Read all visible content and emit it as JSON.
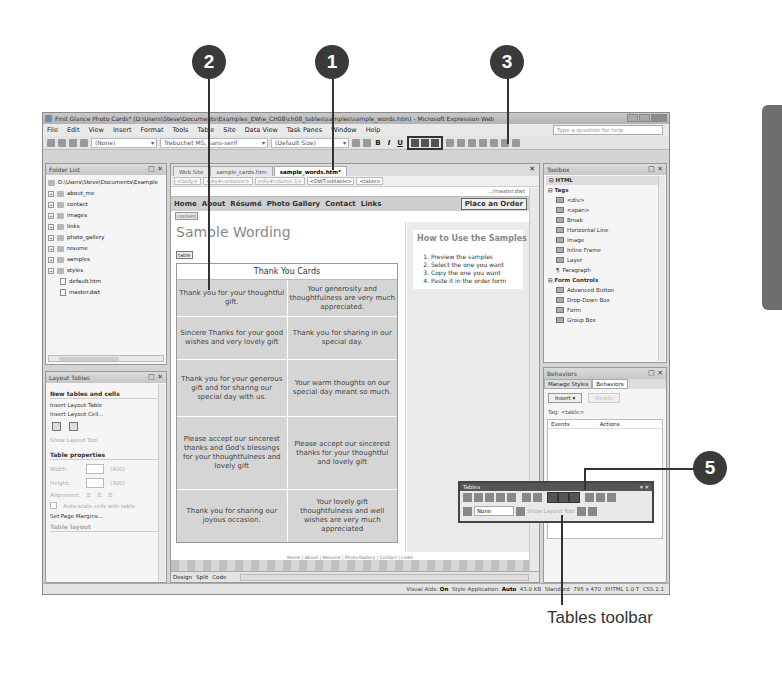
{
  "window": {
    "title": "First Glance Photo Cards* (D:\\Users\\Steve\\Documents\\Examples_EW\\e_CH08\\ch08_tables\\samples\\sample_words.htm) - Microsoft Expression Web"
  },
  "menu": [
    "File",
    "Edit",
    "View",
    "Insert",
    "Format",
    "Tools",
    "Table",
    "Site",
    "Data View",
    "Task Panes",
    "Window",
    "Help"
  ],
  "help_placeholder": "Type a question for help",
  "toolbar": {
    "style": "(None)",
    "font": "Trebuchet MS, sans-serif",
    "size": "(Default Size)",
    "bold": "B",
    "italic": "I",
    "underline": "U"
  },
  "folder_list": {
    "title": "Folder List",
    "root": "D:\\Users\\Steve\\Documents\\Example",
    "folders": [
      "about_me",
      "contact",
      "images",
      "links",
      "photo_gallery",
      "resume",
      "samples",
      "styles"
    ],
    "files": [
      "default.htm",
      "master.dwt"
    ]
  },
  "layout_tables": {
    "title": "Layout Tables",
    "section1": "New tables and cells",
    "insert_table": "Insert Layout Table",
    "insert_cell": "Insert Layout Cell...",
    "show_tool": "Show Layout Tool",
    "section2": "Table properties",
    "width_label": "Width:",
    "width_val": "(400)",
    "height_label": "Height:",
    "height_val": "(300)",
    "alignment_label": "Alignment:",
    "autoscale": "Auto-scale cells with table",
    "margins": "Set Page Margins...",
    "section3": "Table layout"
  },
  "editor": {
    "tabs": [
      "Web Site",
      "sample_cards.htm",
      "sample_words.htm*"
    ],
    "crumbs": [
      "<body>",
      "<div#container>",
      "<div#column_1>",
      "<DWT:editable>",
      "<table>"
    ],
    "master": "../master.dwt",
    "nav": [
      "Home",
      "About",
      "Résumé",
      "Photo Gallery",
      "Contact",
      "Links"
    ],
    "order_button": "Place an Order",
    "content_tag": "content",
    "page_title": "Sample Wording",
    "table_tag": "table",
    "cards_heading": "Thank You Cards",
    "cards": [
      "Thank you for your thoughtful gift.",
      "Your generosity and thoughtfulness are very much appreciated.",
      "Sincere Thanks for your good wishes and very lovely gift",
      "Thank you for sharing in our special day.",
      "Thank you for your generous gift and for sharing our special day with us.",
      "Your warm thoughts on our special day meant so much.",
      "Please accept our sincerest thanks and God's blessings for your thoughtfulness and lovely gift",
      "Please accept our sincerest thanks for your thoughtful and lovely gift",
      "Thank you for sharing our joyous occasion.",
      "Your lovely gift thoughtfulness and well wishes are very much appreciated"
    ],
    "howto_title": "How to Use the Samples",
    "howto_steps": [
      "Preview the samples",
      "Select the one you want",
      "Copy the one you want",
      "Paste it in the order form"
    ],
    "footer_links": "Home | About | Résumé | Photo Gallery | Contact | Links",
    "views": [
      "Design",
      "Split",
      "Code"
    ]
  },
  "toolbox": {
    "title": "Toolbox",
    "category": "HTML",
    "tags_label": "Tags",
    "tags": [
      "<div>",
      "<span>",
      "Break",
      "Horizontal Line",
      "Image",
      "Inline Frame",
      "Layer",
      "Paragraph"
    ],
    "forms_label": "Form Controls",
    "forms": [
      "Advanced Button",
      "Drop-Down Box",
      "Form",
      "Group Box"
    ]
  },
  "behaviors": {
    "title": "Behaviors",
    "tabs": [
      "Manage Styles",
      "Behaviors"
    ],
    "insert": "Insert ▾",
    "delete": "Delete",
    "tag": "Tag:   <table>",
    "col_events": "Events",
    "col_actions": "Actions"
  },
  "tables_toolbar": {
    "title": "Tables",
    "fill": "None",
    "show_tool": "Show Layout Tool"
  },
  "status": {
    "visual_aids_label": "Visual Aids:",
    "visual_aids": "On",
    "style_label": "Style Application:",
    "style": "Auto",
    "size": "43.0 KB",
    "mode": "Standard",
    "dims": "795 x 470",
    "doctype": "XHTML 1.0 T",
    "css": "CSS 2.1"
  },
  "callouts": [
    "1",
    "2",
    "3",
    "5"
  ],
  "caption": "Tables toolbar"
}
